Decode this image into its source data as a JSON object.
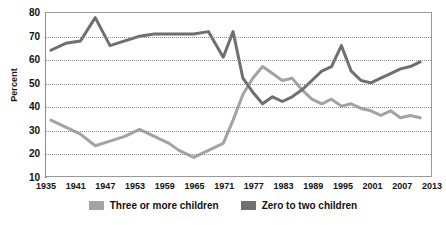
{
  "chart_data": {
    "type": "line",
    "title": "",
    "xlabel": "",
    "ylabel": "Percent",
    "ylim": [
      10,
      80
    ],
    "xlim": [
      1935,
      2013
    ],
    "ytick_labels": [
      "80",
      "70",
      "60",
      "50",
      "40",
      "30",
      "20",
      "10"
    ],
    "ytick_values": [
      80,
      70,
      60,
      50,
      40,
      30,
      20,
      10
    ],
    "xtick_labels": [
      "1935",
      "1941",
      "1947",
      "1953",
      "1959",
      "1965",
      "1971",
      "1977",
      "1983",
      "1989",
      "1995",
      "2001",
      "2007",
      "2013"
    ],
    "xtick_values": [
      1935,
      1941,
      1947,
      1953,
      1959,
      1965,
      1971,
      1977,
      1983,
      1989,
      1995,
      2001,
      2007,
      2013
    ],
    "grid": true,
    "legend_position": "bottom",
    "series": [
      {
        "name": "Three or more children",
        "color": "#a3a3a3",
        "x": [
          1936,
          1939,
          1942,
          1945,
          1948,
          1951,
          1954,
          1957,
          1960,
          1962,
          1965,
          1968,
          1971,
          1973,
          1975,
          1977,
          1979,
          1981,
          1983,
          1985,
          1987,
          1989,
          1991,
          1993,
          1995,
          1997,
          1999,
          2001,
          2003,
          2005,
          2007,
          2009,
          2011
        ],
        "values": [
          34,
          31,
          28,
          23,
          25,
          27,
          30,
          27,
          24,
          21,
          18,
          21,
          24,
          34,
          45,
          52,
          57,
          54,
          51,
          52,
          47,
          43,
          41,
          43,
          40,
          41,
          39,
          38,
          36,
          38,
          35,
          36,
          35
        ]
      },
      {
        "name": "Zero to two children",
        "color": "#6f6f6f",
        "x": [
          1936,
          1939,
          1942,
          1945,
          1948,
          1951,
          1954,
          1957,
          1960,
          1962,
          1965,
          1968,
          1971,
          1973,
          1975,
          1977,
          1979,
          1981,
          1983,
          1985,
          1987,
          1989,
          1991,
          1993,
          1995,
          1997,
          1999,
          2001,
          2003,
          2005,
          2007,
          2009,
          2011
        ],
        "values": [
          64,
          67,
          68,
          78,
          66,
          68,
          70,
          71,
          71,
          71,
          71,
          72,
          61,
          72,
          52,
          46,
          41,
          44,
          42,
          44,
          47,
          51,
          55,
          57,
          66,
          55,
          51,
          50,
          52,
          54,
          56,
          57,
          59
        ]
      }
    ]
  },
  "legend": {
    "items": [
      {
        "label": "Three or more children",
        "color": "#a3a3a3"
      },
      {
        "label": "Zero to two children",
        "color": "#6f6f6f"
      }
    ]
  }
}
